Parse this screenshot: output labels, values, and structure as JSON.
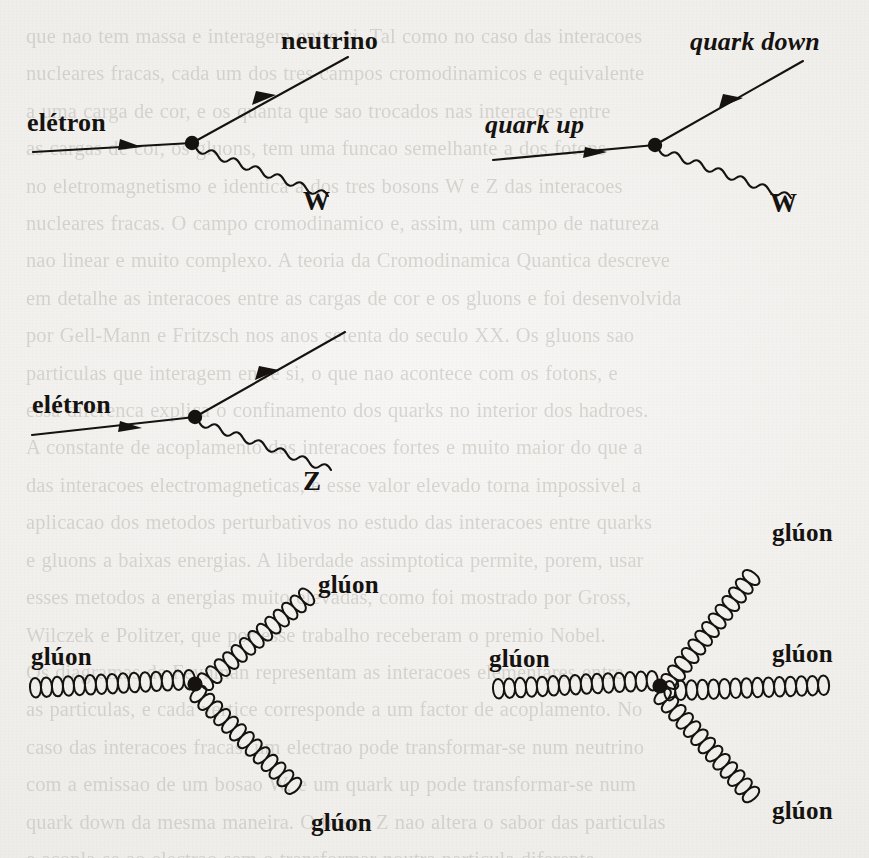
{
  "page": {
    "kind": "scanned-book-page",
    "language": "pt-BR",
    "background_color": "#f1f0ed",
    "ink_color": "#15120f",
    "bleed_text_color": "#b8b6b0",
    "bleed_text": "que nao tem massa e interagem entre si. Tal como no caso das interacoes\nnucleares fracas, cada um dos tres campos cromodinamicos e equivalente\na uma carga de cor, e os quanta que sao trocados nas interacoes entre\nas cargas de cor, os gluons, tem uma funcao semelhante a dos fotons\nno eletromagnetismo e identica a dos tres bosons W e Z das interacoes\nnucleares fracas. O campo cromodinamico e, assim, um campo de natureza\nnao linear e muito complexo. A teoria da Cromodinamica Quantica descreve\nem detalhe as interacoes entre as cargas de cor e os gluons e foi desenvolvida\npor Gell-Mann e Fritzsch nos anos setenta do seculo XX. Os gluons sao\nparticulas que interagem entre si, o que nao acontece com os fotons, e\nessa diferenca explica o confinamento dos quarks no interior dos hadroes.\nA constante de acoplamento das interacoes fortes e muito maior do que a\ndas interacoes electromagneticas, e esse valor elevado torna impossivel a\naplicacao dos metodos perturbativos no estudo das interacoes entre quarks\ne gluons a baixas energias. A liberdade assimptotica permite, porem, usar\nesses metodos a energias muito elevadas, como foi mostrado por Gross,\nWilczek e Politzer, que por esse trabalho receberam o premio Nobel.\nOs diagramas de Feynman representam as interacoes elementares entre\nas particulas, e cada vertice corresponde a um factor de acoplamento. No\ncaso das interacoes fracas, um electrao pode transformar-se num neutrino\ncom a emissao de um bosao W, e um quark up pode transformar-se num\nquark down da mesma maneira. O bosao Z nao altera o sabor das particulas\ne acopla-se ao electrao sem o transformar noutra particula diferente.",
    "diagrams": [
      {
        "id": "weak-charged-lepton",
        "name": "electron-neutrino-W-vertex",
        "position": "top-left",
        "legs": [
          {
            "name": "incoming-electron",
            "label": "elétron",
            "style": "fermion",
            "italic": false,
            "arrow": true
          },
          {
            "name": "outgoing-neutrino",
            "label": "neutrino",
            "style": "fermion",
            "italic": false,
            "arrow": true
          },
          {
            "name": "emitted-boson",
            "label": "W",
            "style": "wavy",
            "italic": false,
            "arrow": false
          }
        ]
      },
      {
        "id": "weak-charged-quark",
        "name": "quark-up-quark-down-W-vertex",
        "position": "top-right",
        "legs": [
          {
            "name": "incoming-quark-up",
            "label": "quark up",
            "style": "fermion",
            "italic": true,
            "arrow": true
          },
          {
            "name": "outgoing-quark-down",
            "label": "quark down",
            "style": "fermion",
            "italic": true,
            "arrow": true
          },
          {
            "name": "emitted-boson",
            "label": "W",
            "style": "wavy",
            "italic": false,
            "arrow": false
          }
        ]
      },
      {
        "id": "weak-neutral-current",
        "name": "electron-Z-vertex",
        "position": "middle-left",
        "legs": [
          {
            "name": "incoming-electron",
            "label": "elétron",
            "style": "fermion",
            "italic": false,
            "arrow": true
          },
          {
            "name": "outgoing-electron",
            "label": "",
            "style": "fermion",
            "italic": false,
            "arrow": true
          },
          {
            "name": "emitted-boson",
            "label": "Z",
            "style": "wavy",
            "italic": false,
            "arrow": false
          }
        ]
      },
      {
        "id": "three-gluon-vertex",
        "name": "triple-gluon-vertex",
        "position": "bottom-left",
        "legs": [
          {
            "name": "incoming-gluon",
            "label": "glúon",
            "style": "coil",
            "italic": false,
            "arrow": false
          },
          {
            "name": "outgoing-gluon-upper",
            "label": "glúon",
            "style": "coil",
            "italic": false,
            "arrow": false
          },
          {
            "name": "outgoing-gluon-lower",
            "label": "glúon",
            "style": "coil",
            "italic": false,
            "arrow": false
          }
        ]
      },
      {
        "id": "four-gluon-vertex",
        "name": "quartic-gluon-vertex",
        "position": "bottom-right",
        "legs": [
          {
            "name": "incoming-gluon",
            "label": "glúon",
            "style": "coil",
            "italic": false,
            "arrow": false
          },
          {
            "name": "outgoing-gluon-upper",
            "label": "glúon",
            "style": "coil",
            "italic": false,
            "arrow": false
          },
          {
            "name": "outgoing-gluon-middle",
            "label": "glúon",
            "style": "coil",
            "italic": false,
            "arrow": false
          },
          {
            "name": "outgoing-gluon-lower",
            "label": "glúon",
            "style": "coil",
            "italic": false,
            "arrow": false
          }
        ]
      }
    ]
  },
  "labels": {
    "d1_in": "elétron",
    "d1_out": "neutrino",
    "d1_boson": "W",
    "d2_in": "quark up",
    "d2_out": "quark down",
    "d2_boson": "W",
    "d3_in": "elétron",
    "d3_boson": "Z",
    "d4_in": "glúon",
    "d4_up": "glúon",
    "d4_down": "glúon",
    "d5_in": "glúon",
    "d5_up": "glúon",
    "d5_mid": "glúon",
    "d5_down": "glúon"
  }
}
